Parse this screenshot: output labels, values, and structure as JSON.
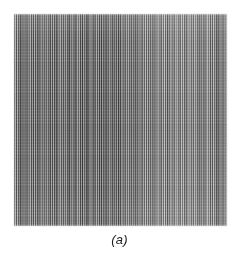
{
  "figure": {
    "caption": "(a)",
    "subfigure_label": "a",
    "alt_description": "Grayscale image of fine vertical stripes showing aliasing / moire artifacts",
    "plate": {
      "x": 14,
      "y": 14,
      "width": 213,
      "height": 212
    }
  },
  "page": {
    "background_color": "#ffffff",
    "width": 239,
    "height": 261
  },
  "chart_data": {
    "type": "heatmap",
    "title": "",
    "subtitle": "",
    "xlabel": "",
    "ylabel": "",
    "annotations": [
      "(a)"
    ],
    "legend": [],
    "grid": false,
    "pattern": {
      "orientation": "vertical",
      "stripe_period_px": 2.13,
      "approx_stripe_count": 100,
      "beat_period_px": 2.36,
      "harmonic_period_px": 6.14,
      "base_gray": "#8a8a8a",
      "dark_stripe": "#565656",
      "light_stripe": "#bdbdbd",
      "contrast_profile": "high contrast on left and centre, progressively washed out toward the right third",
      "moire_band_centers_px": [
        22,
        55,
        95,
        108,
        150,
        186
      ]
    },
    "colors": {
      "min_gray": "#4a4a4a",
      "mid_gray": "#8a8a8a",
      "max_gray": "#c6c6c6",
      "page_white": "#ffffff",
      "caption_ink": "#1d1d1d"
    },
    "axis": {
      "x_range_px": [
        0,
        213
      ],
      "y_range_px": [
        0,
        212
      ],
      "ticks": []
    }
  }
}
